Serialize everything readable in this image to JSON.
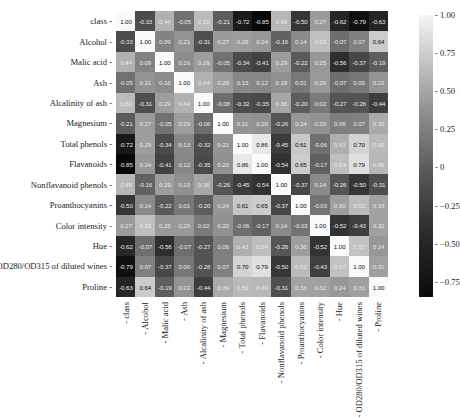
{
  "chart_data": {
    "type": "heatmap",
    "title": "",
    "xlabel": "",
    "ylabel": "",
    "labels": [
      "class",
      "Alcohol",
      "Malic acid",
      "Ash",
      "Alcalinity of ash",
      "Magnesium",
      "Total phenols",
      "Flavanoids",
      "Nonflavanoid phenols",
      "Proanthocyanins",
      "Color intensity",
      "Hue",
      "OD280/OD315 of diluted wines",
      "Proline"
    ],
    "matrix": [
      [
        1.0,
        -0.33,
        0.44,
        -0.05,
        0.52,
        -0.21,
        -0.72,
        -0.85,
        0.49,
        -0.5,
        0.27,
        -0.62,
        -0.79,
        -0.63
      ],
      [
        -0.33,
        1.0,
        0.09,
        0.21,
        -0.31,
        0.27,
        0.29,
        0.24,
        -0.16,
        0.14,
        0.55,
        -0.07,
        0.07,
        0.64
      ],
      [
        0.44,
        0.09,
        1.0,
        0.16,
        0.29,
        -0.05,
        -0.34,
        -0.41,
        0.29,
        -0.22,
        0.25,
        -0.56,
        -0.37,
        -0.19
      ],
      [
        -0.05,
        0.21,
        0.16,
        1.0,
        0.44,
        0.29,
        0.13,
        0.12,
        0.19,
        0.01,
        0.26,
        -0.07,
        0.0,
        0.22
      ],
      [
        0.52,
        -0.31,
        0.29,
        0.44,
        1.0,
        -0.08,
        -0.32,
        -0.35,
        0.36,
        -0.2,
        0.02,
        -0.27,
        -0.28,
        -0.44
      ],
      [
        -0.21,
        0.27,
        -0.05,
        0.29,
        -0.08,
        1.0,
        0.21,
        0.2,
        -0.26,
        0.24,
        0.2,
        0.06,
        0.07,
        0.39
      ],
      [
        -0.72,
        0.29,
        -0.34,
        0.13,
        -0.32,
        0.21,
        1.0,
        0.86,
        -0.45,
        0.61,
        -0.06,
        0.43,
        0.7,
        0.5
      ],
      [
        -0.85,
        0.24,
        -0.41,
        0.12,
        -0.35,
        0.2,
        0.86,
        1.0,
        -0.54,
        0.65,
        -0.17,
        0.54,
        0.79,
        0.49
      ],
      [
        0.49,
        -0.16,
        0.29,
        0.19,
        0.36,
        -0.26,
        -0.45,
        -0.54,
        1.0,
        -0.37,
        0.14,
        -0.26,
        -0.5,
        -0.31
      ],
      [
        -0.5,
        0.14,
        -0.22,
        0.01,
        -0.2,
        0.24,
        0.61,
        0.65,
        -0.37,
        1.0,
        -0.03,
        0.3,
        0.52,
        0.33
      ],
      [
        0.27,
        0.55,
        0.25,
        0.26,
        0.02,
        0.2,
        -0.06,
        -0.17,
        0.14,
        -0.03,
        1.0,
        -0.52,
        -0.43,
        0.32
      ],
      [
        -0.62,
        -0.07,
        -0.56,
        -0.07,
        -0.27,
        0.06,
        0.43,
        0.54,
        -0.26,
        0.3,
        -0.52,
        1.0,
        0.57,
        0.24
      ],
      [
        -0.79,
        0.07,
        -0.37,
        0.0,
        -0.28,
        0.07,
        0.7,
        0.79,
        -0.5,
        0.52,
        -0.43,
        0.57,
        1.0,
        0.31
      ],
      [
        -0.63,
        0.64,
        -0.19,
        0.22,
        -0.44,
        0.39,
        0.5,
        0.49,
        -0.31,
        0.33,
        0.32,
        0.24,
        0.31,
        1.0
      ]
    ],
    "colormap": "greys_r (black = low, white = high)",
    "vmin": -0.85,
    "vmax": 1.0,
    "colorbar_ticks": [
      "1.00",
      "0.75",
      "0.50",
      "0.25",
      "0",
      "−0.25",
      "−0.50",
      "−0.75"
    ],
    "annotations": true,
    "grid": false,
    "legend_position": "right (colorbar)"
  }
}
